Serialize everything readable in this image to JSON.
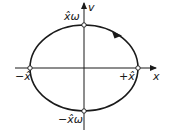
{
  "diagram": {
    "type": "phase-space ellipse",
    "axes": {
      "x_label": "x",
      "y_label": "v"
    },
    "points": {
      "top": "x̂ω",
      "bottom": "−x̂ω",
      "left": "−x̂",
      "right": "+x̂"
    },
    "direction": "clockwise",
    "colors": {
      "stroke": "#1a1a1a",
      "background": "#ffffff"
    }
  }
}
